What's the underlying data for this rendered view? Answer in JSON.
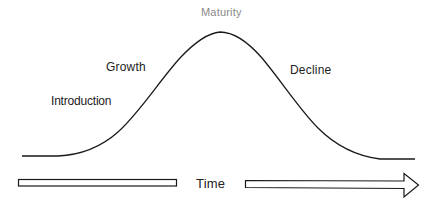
{
  "diagram": {
    "stages": [
      {
        "id": "introduction",
        "label": "Introduction"
      },
      {
        "id": "growth",
        "label": "Growth"
      },
      {
        "id": "maturity",
        "label": "Maturity"
      },
      {
        "id": "decline",
        "label": "Decline"
      }
    ],
    "axis": {
      "label": "Time",
      "direction": "left-to-right"
    },
    "colors": {
      "curve": "#1a1a1a",
      "text": "#222222",
      "maturity_text": "#8a8a8a",
      "arrow_stroke": "#1a1a1a",
      "arrow_fill": "#ffffff",
      "background": "#ffffff"
    }
  }
}
